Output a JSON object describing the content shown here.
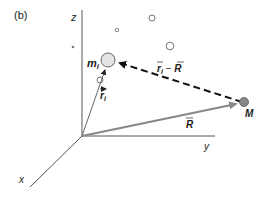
{
  "panel_label": "(b)",
  "axes": {
    "z_label": "z",
    "y_label": "y",
    "x_label": "x"
  },
  "particle": {
    "mass_label": "m",
    "mass_subscript": "i",
    "position_vector_label": "r",
    "position_vector_subscript": "i"
  },
  "center_of_mass": {
    "label": "M",
    "vector_label": "R"
  },
  "relative_vector": {
    "r": "r",
    "sub": "i",
    "minus": " − ",
    "R": "R"
  },
  "colors": {
    "axis": "#555555",
    "R_arrow": "#888888",
    "dashed_arrow": "#111111",
    "M_fill": "#888888",
    "circle_stroke": "#666666",
    "m_fill": "#e4e4e4"
  }
}
